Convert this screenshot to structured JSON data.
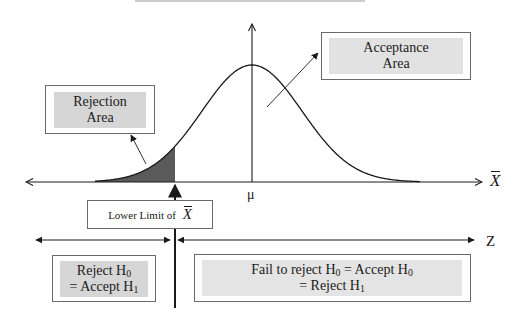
{
  "diagram": {
    "axes": {
      "horizontal_label": "X",
      "horizontal_label_has_bar": true,
      "vertical_marker_label": "μ",
      "z_axis_label": "Z"
    },
    "regions": {
      "rejection": {
        "line1": "Rejection",
        "line2": "Area"
      },
      "acceptance": {
        "line1": "Acceptance",
        "line2": "Area"
      }
    },
    "critical_value": {
      "label_prefix": "Lower Limit of ",
      "label_symbol": "X"
    },
    "decisions": {
      "reject": {
        "line1_text": "Reject H",
        "line1_sub": "0",
        "line2_text": "= Accept H",
        "line2_sub": "1"
      },
      "fail_to_reject": {
        "line1_text_a": "Fail to reject H",
        "line1_sub_a": "0",
        "line1_text_b": " = Accept H",
        "line1_sub_b": "0",
        "line2_text": "= Reject H",
        "line2_sub": "1"
      }
    },
    "colors": {
      "shaded_area": "#5a5a5a",
      "box_fill": "#d6d6d6",
      "box_border": "#6a6a6a",
      "line": "#1a1a1a"
    }
  }
}
